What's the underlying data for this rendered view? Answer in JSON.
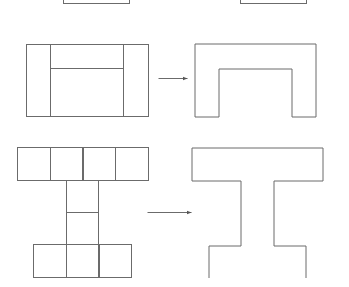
{
  "diagram": {
    "stroke_color": "#6b6b6b",
    "background": "#ffffff",
    "rows": [
      {
        "name": "partial-row",
        "left": {
          "label": "",
          "rect": [
            63,
            -20,
            66,
            23
          ]
        },
        "right": {
          "label": "",
          "rect": [
            240,
            -20,
            66,
            23
          ]
        }
      },
      {
        "name": "h-to-arch",
        "left": {
          "description": "H shape composed of two vertical pillars and a top crossbar",
          "outer": [
            26,
            44,
            122,
            72
          ],
          "pillar_left": [
            26,
            44,
            24,
            72
          ],
          "pillar_right": [
            123,
            44,
            25,
            72
          ],
          "crossbar_bottom_y": 68
        },
        "arrow": {
          "x1": 158,
          "x2": 187,
          "y": 78
        },
        "right": {
          "description": "Merged arch outline",
          "points": "195,44 316,44 316,117 292,117 292,69 219,69 219,117 195,117 195,44"
        }
      },
      {
        "name": "i-blocks-to-i-beam",
        "left": {
          "description": "I shape made of unit squares: 4 top, 2 stem, 3 bottom",
          "top_row": {
            "x": 17,
            "y": 147,
            "count": 4,
            "size": 32.5
          },
          "stem": {
            "x": 66,
            "y": 180,
            "count": 2,
            "size": 32
          },
          "bottom_row": {
            "x": 33,
            "y": 244,
            "count": 3,
            "size": 32.5
          }
        },
        "arrow": {
          "x1": 147,
          "x2": 191,
          "y": 212
        },
        "right": {
          "description": "Merged I-beam outline (bottom edge open/faint)",
          "points": "209,278 209,246 241,246 241,181 192,181 192,148 323,148 323,181 274,181 274,246 306,246 306,278"
        }
      }
    ]
  }
}
